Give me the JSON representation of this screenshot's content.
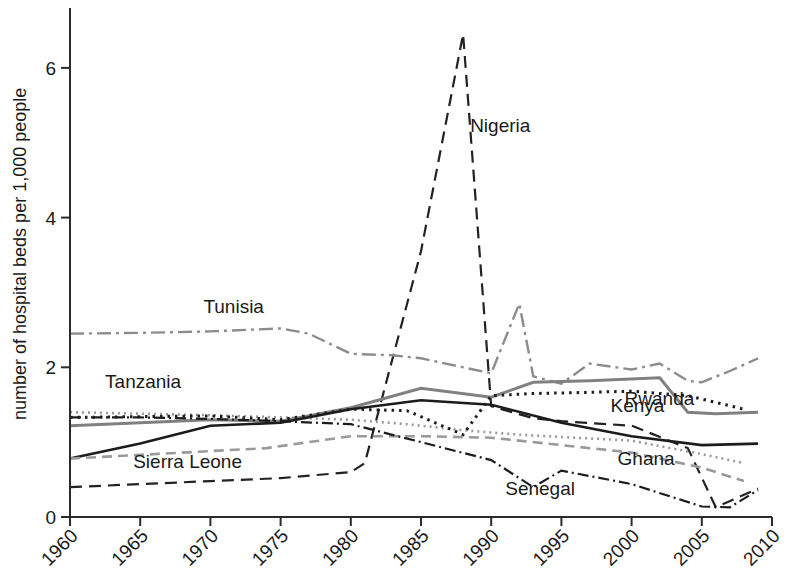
{
  "chart_data": {
    "type": "line",
    "title": "",
    "xlabel": "",
    "ylabel": "number of hospital beds per 1,000 people",
    "xlim": [
      1960,
      2010
    ],
    "ylim": [
      0,
      6.8
    ],
    "xticks": [
      1960,
      1965,
      1970,
      1975,
      1980,
      1985,
      1990,
      1995,
      2000,
      2005,
      2010
    ],
    "yticks": [
      0,
      2,
      4,
      6
    ],
    "xtick_labels": [
      "1960",
      "1965",
      "1970",
      "1975",
      "1980",
      "1985",
      "1990",
      "1995",
      "2000",
      "2005",
      "2010"
    ],
    "ytick_labels": [
      "0",
      "2",
      "4",
      "6"
    ],
    "grid": false,
    "legend": "inline-labels",
    "series": [
      {
        "name": "Nigeria",
        "color": "#222222",
        "dash": "12,7",
        "width": 2.2,
        "label_x": 1988.5,
        "label_y": 5.15,
        "x": [
          1960,
          1965,
          1970,
          1975,
          1980,
          1981,
          1985,
          1988,
          1990,
          1993,
          1995,
          2000,
          2004,
          2006,
          2009
        ],
        "y": [
          0.4,
          0.44,
          0.48,
          0.52,
          0.6,
          0.72,
          3.55,
          6.45,
          1.48,
          1.32,
          1.28,
          1.22,
          0.92,
          0.13,
          0.38
        ]
      },
      {
        "name": "Tunisia",
        "color": "#8c8c8c",
        "dash": "14,5,3,5",
        "width": 2.4,
        "label_x": 1969.5,
        "label_y": 2.73,
        "x": [
          1960,
          1965,
          1970,
          1975,
          1977,
          1980,
          1983,
          1985,
          1990,
          1992,
          1993,
          1995,
          1997,
          2000,
          2002,
          2004,
          2005,
          2007,
          2009
        ],
        "y": [
          2.45,
          2.46,
          2.48,
          2.52,
          2.45,
          2.18,
          2.16,
          2.12,
          1.92,
          2.85,
          1.88,
          1.78,
          2.05,
          1.97,
          2.05,
          1.82,
          1.8,
          1.95,
          2.12
        ]
      },
      {
        "name": "Tanzania",
        "color": "#9a9a9a",
        "dash": "2,4",
        "width": 2.6,
        "label_x": 1962.5,
        "label_y": 1.72,
        "x": [
          1960,
          1965,
          1970,
          1975,
          1980,
          1984,
          1988,
          1992,
          1996,
          2000,
          2005,
          2008
        ],
        "y": [
          1.4,
          1.38,
          1.36,
          1.33,
          1.3,
          1.24,
          1.16,
          1.1,
          1.06,
          1.02,
          0.84,
          0.72
        ]
      },
      {
        "name": "Kenya",
        "color": "#808080",
        "dash": "",
        "width": 3.0,
        "label_x": 1998.5,
        "label_y": 1.4,
        "x": [
          1960,
          1970,
          1975,
          1980,
          1985,
          1990,
          1993,
          1997,
          2002,
          2004,
          2006,
          2009
        ],
        "y": [
          1.22,
          1.3,
          1.28,
          1.46,
          1.72,
          1.6,
          1.8,
          1.82,
          1.86,
          1.4,
          1.38,
          1.4
        ]
      },
      {
        "name": "Ghana",
        "color": "#1c1c1c",
        "dash": "",
        "width": 2.6,
        "label_x": 1999.0,
        "label_y": 0.7,
        "x": [
          1960,
          1965,
          1970,
          1975,
          1980,
          1985,
          1990,
          1995,
          2000,
          2005,
          2009
        ],
        "y": [
          0.78,
          0.98,
          1.22,
          1.26,
          1.44,
          1.56,
          1.5,
          1.26,
          1.08,
          0.96,
          0.98
        ]
      },
      {
        "name": "Rwanda",
        "color": "#1c1c1c",
        "dash": "2.5,5",
        "width": 3.0,
        "label_x": 1999.5,
        "label_y": 1.5,
        "x": [
          1960,
          1970,
          1975,
          1980,
          1984,
          1988,
          1990,
          1993,
          1996,
          2000,
          2004,
          2008
        ],
        "y": [
          1.33,
          1.35,
          1.3,
          1.44,
          1.42,
          1.1,
          1.62,
          1.65,
          1.66,
          1.68,
          1.62,
          1.44
        ]
      },
      {
        "name": "Sierra Leone",
        "color": "#9a9a9a",
        "dash": "10,6",
        "width": 2.6,
        "label_x": 1964.5,
        "label_y": 0.66,
        "x": [
          1960,
          1968,
          1974,
          1980,
          1985,
          1990,
          1995,
          2000,
          2005,
          2008
        ],
        "y": [
          0.78,
          0.86,
          0.92,
          1.08,
          1.08,
          1.06,
          0.96,
          0.86,
          0.66,
          0.48
        ]
      },
      {
        "name": "Senegal",
        "color": "#1c1c1c",
        "dash": "11,4,2,4",
        "width": 2.2,
        "label_x": 1991.0,
        "label_y": 0.3,
        "x": [
          1960,
          1965,
          1970,
          1975,
          1980,
          1985,
          1990,
          1993,
          1995,
          2000,
          2005,
          2007,
          2009
        ],
        "y": [
          1.33,
          1.33,
          1.31,
          1.28,
          1.24,
          1.0,
          0.76,
          0.4,
          0.62,
          0.44,
          0.14,
          0.13,
          0.36
        ]
      }
    ],
    "annotations": [
      {
        "text": "Nigeria"
      },
      {
        "text": "Tunisia"
      },
      {
        "text": "Tanzania"
      },
      {
        "text": "Kenya"
      },
      {
        "text": "Ghana"
      },
      {
        "text": "Rwanda"
      },
      {
        "text": "Sierra Leone"
      },
      {
        "text": "Senegal"
      }
    ]
  }
}
